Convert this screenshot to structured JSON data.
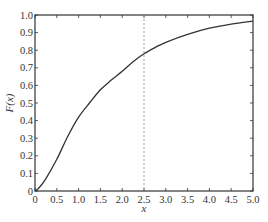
{
  "chart_data": {
    "type": "line",
    "title": "",
    "xlabel": "x",
    "ylabel": "F(x)",
    "xlim": [
      0,
      5.0
    ],
    "ylim": [
      0,
      1.0
    ],
    "grid": false,
    "legend": null,
    "x_ticks": [
      "0",
      "0.5",
      "1.0",
      "1.5",
      "2.0",
      "2.5",
      "3.0",
      "3.5",
      "4.0",
      "4.5",
      "5.0"
    ],
    "y_ticks": [
      "0",
      "0.1",
      "0.2",
      "0.3",
      "0.4",
      "0.5",
      "0.6",
      "0.7",
      "0.8",
      "0.9",
      "1.0"
    ],
    "series": [
      {
        "name": "F(x)",
        "style": "solid",
        "color": "#333333",
        "x": [
          0,
          0.1,
          0.25,
          0.5,
          0.75,
          1.0,
          1.25,
          1.5,
          1.75,
          2.0,
          2.25,
          2.5,
          2.75,
          3.0,
          3.5,
          4.0,
          4.5,
          5.0
        ],
        "y": [
          0,
          0.02,
          0.07,
          0.18,
          0.31,
          0.42,
          0.5,
          0.575,
          0.63,
          0.68,
          0.735,
          0.78,
          0.815,
          0.845,
          0.89,
          0.925,
          0.948,
          0.965
        ]
      }
    ],
    "annotations": [
      {
        "type": "vertical-dashed-line",
        "x": 2.5,
        "color": "#888888"
      }
    ]
  }
}
